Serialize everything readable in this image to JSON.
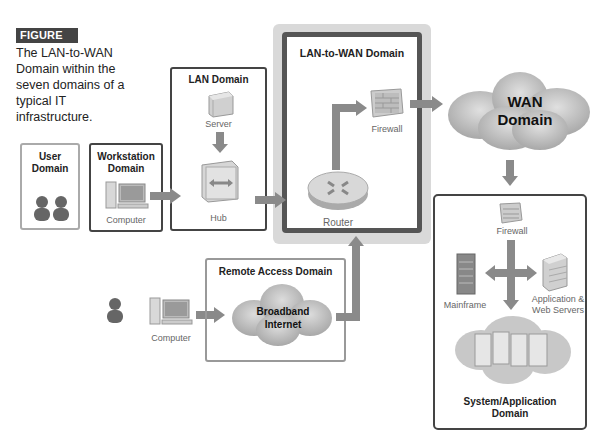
{
  "figure": {
    "badge": "FIGURE 11-1",
    "caption": "The LAN-to-WAN Domain within the seven domains of a typical IT infrastructure."
  },
  "domains": {
    "user": {
      "title_line1": "User",
      "title_line2": "Domain"
    },
    "workstation": {
      "title_line1": "Workstation",
      "title_line2": "Domain",
      "device": "Computer"
    },
    "lan": {
      "title": "LAN Domain",
      "server": "Server",
      "hub": "Hub"
    },
    "lan_to_wan": {
      "title": "LAN-to-WAN Domain",
      "firewall": "Firewall",
      "router": "Router"
    },
    "wan": {
      "title_line1": "WAN",
      "title_line2": "Domain"
    },
    "remote_access": {
      "title": "Remote Access Domain",
      "cloud_line1": "Broadband",
      "cloud_line2": "Internet",
      "device": "Computer"
    },
    "system_application": {
      "firewall": "Firewall",
      "mainframe": "Mainframe",
      "servers_line1": "Application &",
      "servers_line2": "Web Servers",
      "title_line1": "System/Application",
      "title_line2": "Domain"
    }
  },
  "colors": {
    "arrow": "#8a8a8a",
    "badge_bg": "#444444",
    "highlight_bg": "#d9d9d9",
    "box_dark": "#444444",
    "box_light": "#999999"
  }
}
